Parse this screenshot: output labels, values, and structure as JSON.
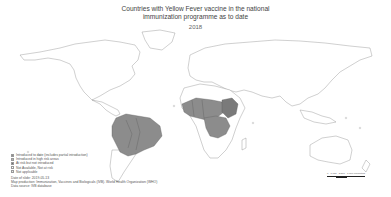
{
  "title": {
    "line1": "Countries with Yellow Fever vaccine in the national",
    "line2": "immunization programme as to date",
    "year": "2018"
  },
  "legend": {
    "items": [
      {
        "label": "Introduced to date (includes partial introduction)",
        "color": "#8c8c8c"
      },
      {
        "label": "Introduced in high risk areas",
        "color": "#b4b4b4"
      },
      {
        "label": "At risk but not introduced",
        "color": "#6e6e6e"
      },
      {
        "label": "Not Available, Not at risk",
        "color": "#ffffff"
      },
      {
        "label": "Not applicable",
        "color": "#e8e8e8"
      }
    ]
  },
  "notes": {
    "date": "Date of slide: 2019-05-13",
    "production": "Map production: Immunization, Vaccines and Biologicals (IVB). World Health Organization (WHO)",
    "source": "Data source: IVB database"
  },
  "scale": {
    "labels": [
      "0",
      "1,750",
      "3,500",
      "7,000 Kilometers"
    ]
  },
  "colors": {
    "introduced": "#8c8c8c",
    "partial": "#9a9a9a",
    "outline": "#777777",
    "land": "#ffffff"
  }
}
